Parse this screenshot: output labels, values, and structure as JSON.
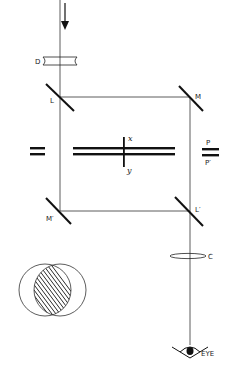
{
  "diagram": {
    "type": "optical-interferometer-schematic",
    "colors": {
      "line": "#1a1a1a",
      "background": "#ffffff"
    },
    "labels": {
      "diverging_lens": "D",
      "beam_splitter_in": "L",
      "mirror_top": "M",
      "mirror_bottom": "M′",
      "beam_splitter_out": "L′",
      "axis_x": "x",
      "axis_y": "y",
      "plate_p": "P",
      "plate_p_prime": "P′",
      "condenser_lens": "C",
      "eye": "EYE"
    },
    "components": [
      {
        "id": "incoming-light-arrow",
        "kind": "arrow"
      },
      {
        "id": "diverging-lens",
        "kind": "lens",
        "label_ref": "D"
      },
      {
        "id": "beam-splitter-L",
        "kind": "half-mirror",
        "label_ref": "L"
      },
      {
        "id": "mirror-M",
        "kind": "mirror",
        "label_ref": "M"
      },
      {
        "id": "mirror-M-prime",
        "kind": "mirror",
        "label_ref": "M′"
      },
      {
        "id": "beam-splitter-L-prime",
        "kind": "half-mirror",
        "label_ref": "L′"
      },
      {
        "id": "specimen-plates",
        "kind": "plates",
        "axes": [
          "x",
          "y"
        ]
      },
      {
        "id": "compensator-plates-left",
        "kind": "plates"
      },
      {
        "id": "compensator-plates-P",
        "kind": "plates",
        "labels": [
          "P",
          "P′"
        ]
      },
      {
        "id": "condenser-C",
        "kind": "lens",
        "label_ref": "C"
      },
      {
        "id": "eye",
        "kind": "observer",
        "label_ref": "EYE"
      },
      {
        "id": "overlap-circles",
        "kind": "inset",
        "description": "two overlapping circles with hatched intersection"
      }
    ]
  }
}
